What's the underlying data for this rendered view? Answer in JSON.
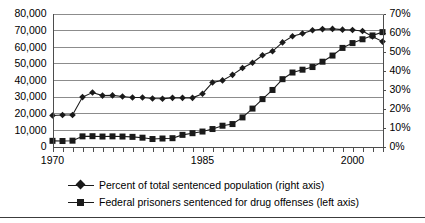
{
  "chart_data": {
    "type": "line",
    "title": "",
    "subtitle": "",
    "xlabel": "",
    "ylabel": "",
    "grid": true,
    "legend_position": "bottom",
    "x": [
      1970,
      1971,
      1972,
      1973,
      1974,
      1975,
      1976,
      1977,
      1978,
      1979,
      1980,
      1981,
      1982,
      1983,
      1984,
      1985,
      1986,
      1987,
      1988,
      1989,
      1990,
      1991,
      1992,
      1993,
      1994,
      1995,
      1996,
      1997,
      1998,
      1999,
      2000,
      2001,
      2002,
      2003
    ],
    "xtick_labels": [
      "1970",
      "1985",
      "2000"
    ],
    "xtick_values": [
      1970,
      1985,
      2000
    ],
    "xlim": [
      1970,
      2003
    ],
    "left_axis": {
      "label": "",
      "ylim": [
        0,
        80000
      ],
      "ticks": [
        0,
        10000,
        20000,
        30000,
        40000,
        50000,
        60000,
        70000,
        80000
      ],
      "tick_labels": [
        "0",
        "10,000",
        "20,000",
        "30,000",
        "40,000",
        "50,000",
        "60,000",
        "70,000",
        "80,000"
      ]
    },
    "right_axis": {
      "label": "",
      "ylim": [
        0,
        70
      ],
      "ticks": [
        0,
        10,
        20,
        30,
        40,
        50,
        60,
        70
      ],
      "tick_labels": [
        "0%",
        "10%",
        "20%",
        "30%",
        "40%",
        "50%",
        "60%",
        "70%"
      ]
    },
    "series": [
      {
        "name": "Percent of total sentenced population (right axis)",
        "axis": "right",
        "marker": "diamond",
        "color": "#1a1a1a",
        "unit": "%",
        "values": [
          16.3,
          16.6,
          16.6,
          26.0,
          28.4,
          26.8,
          26.9,
          26.3,
          25.8,
          25.8,
          25.3,
          25.1,
          25.6,
          25.6,
          25.6,
          27.8,
          33.7,
          34.8,
          37.7,
          41.3,
          44.1,
          48.0,
          50.1,
          54.8,
          58.0,
          59.5,
          61.2,
          61.8,
          61.9,
          61.5,
          61.3,
          60.8,
          57.9,
          55.2
        ]
      },
      {
        "name": "Federal prisoners sentenced for drug offenses (left axis)",
        "axis": "left",
        "marker": "square",
        "color": "#1a1a1a",
        "unit": "prisoners",
        "values": [
          3400,
          3300,
          3500,
          6100,
          6200,
          6000,
          6100,
          6000,
          5800,
          5300,
          4500,
          4800,
          5000,
          7000,
          8000,
          9000,
          10500,
          12500,
          13500,
          17500,
          22800,
          28500,
          34000,
          40500,
          44500,
          46200,
          47800,
          51000,
          54700,
          59300,
          62200,
          64500,
          66800,
          68800
        ]
      }
    ]
  },
  "legend": {
    "items": [
      {
        "label": "Percent of total sentenced population (right axis)",
        "marker": "diamond"
      },
      {
        "label": "Federal prisoners sentenced for drug offenses (left axis)",
        "marker": "square"
      }
    ]
  }
}
